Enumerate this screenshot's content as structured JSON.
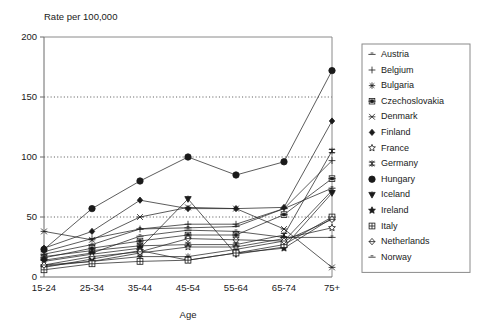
{
  "chart_data": {
    "type": "line",
    "title": "Rate per 100,000",
    "xlabel": "Age",
    "ylabel": "",
    "categories": [
      "15-24",
      "25-34",
      "35-44",
      "45-54",
      "55-64",
      "65-74",
      "75+"
    ],
    "ylim": [
      0,
      200
    ],
    "yticks": [
      0,
      50,
      100,
      150,
      200
    ],
    "grid": "horizontal-dotted",
    "legend_position": "right",
    "series": [
      {
        "name": "Austria",
        "marker": "dash",
        "values": [
          19,
          27,
          40,
          41,
          42,
          57,
          74
        ]
      },
      {
        "name": "Belgium",
        "marker": "plus",
        "values": [
          21,
          32,
          40,
          44,
          44,
          57,
          97
        ]
      },
      {
        "name": "Bulgaria",
        "marker": "asterisk",
        "values": [
          10,
          13,
          17,
          17,
          23,
          30,
          72
        ]
      },
      {
        "name": "Czechoslovakia",
        "marker": "square-dot",
        "values": [
          16,
          24,
          30,
          35,
          35,
          52,
          82
        ]
      },
      {
        "name": "Denmark",
        "marker": "x-star",
        "values": [
          38,
          31,
          50,
          58,
          57,
          40,
          8
        ]
      },
      {
        "name": "Finland",
        "marker": "diamond",
        "values": [
          24,
          38,
          64,
          57,
          57,
          58,
          130
        ]
      },
      {
        "name": "France",
        "marker": "star-open",
        "values": [
          9,
          13,
          20,
          25,
          25,
          32,
          41
        ]
      },
      {
        "name": "Germany",
        "marker": "double-cross",
        "values": [
          17,
          22,
          26,
          27,
          27,
          35,
          105
        ]
      },
      {
        "name": "Hungary",
        "marker": "filled-circle",
        "values": [
          23,
          57,
          80,
          100,
          85,
          96,
          172
        ]
      },
      {
        "name": "Iceland",
        "marker": "triangle-down",
        "values": [
          13,
          19,
          24,
          65,
          19,
          25,
          70
        ]
      },
      {
        "name": "Ireland",
        "marker": "star-filled",
        "values": [
          8,
          15,
          22,
          14,
          20,
          24,
          49
        ]
      },
      {
        "name": "Italy",
        "marker": "square-grid",
        "values": [
          6,
          11,
          13,
          14,
          20,
          27,
          50
        ]
      },
      {
        "name": "Netherlands",
        "marker": "diamond-open",
        "values": [
          10,
          17,
          21,
          32,
          31,
          30,
          48
        ]
      },
      {
        "name": "Norway",
        "marker": "dash",
        "values": [
          14,
          20,
          34,
          39,
          38,
          33,
          33
        ]
      }
    ]
  },
  "legend": {
    "items": [
      {
        "label": "Austria"
      },
      {
        "label": "Belgium"
      },
      {
        "label": "Bulgaria"
      },
      {
        "label": "Czechoslovakia"
      },
      {
        "label": "Denmark"
      },
      {
        "label": "Finland"
      },
      {
        "label": "France"
      },
      {
        "label": "Germany"
      },
      {
        "label": "Hungary"
      },
      {
        "label": "Iceland"
      },
      {
        "label": "Ireland"
      },
      {
        "label": "Italy"
      },
      {
        "label": "Netherlands"
      },
      {
        "label": "Norway"
      }
    ]
  },
  "colors": {
    "ink": "#1a1a1a",
    "line": "#262626",
    "frame": "#8a8a8a",
    "grid": "#3a3a3a",
    "background": "#ffffff"
  }
}
